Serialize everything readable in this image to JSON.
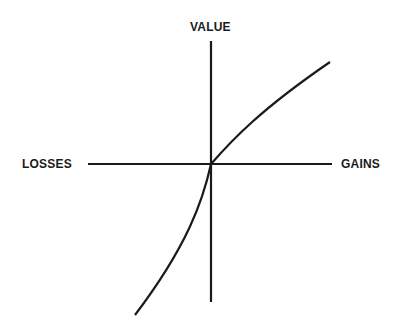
{
  "diagram": {
    "labels": {
      "y_axis": "VALUE",
      "x_left": "LOSSES",
      "x_right": "GAINS"
    },
    "colors": {
      "background": "#ffffff",
      "stroke": "#1a1a1a"
    },
    "axes": {
      "origin": [
        211,
        164
      ],
      "horizontal": {
        "x1": 88,
        "x2": 332,
        "y": 164
      },
      "vertical": {
        "x": 211,
        "y1": 41,
        "y2": 302
      }
    },
    "curve": {
      "description": "S-shaped value curve: concave for gains, convex and steeper for losses",
      "gains_segment": {
        "start": [
          211,
          164
        ],
        "end": [
          330,
          62
        ]
      },
      "losses_segment": {
        "start": [
          211,
          164
        ],
        "end": [
          135,
          315
        ]
      }
    }
  }
}
